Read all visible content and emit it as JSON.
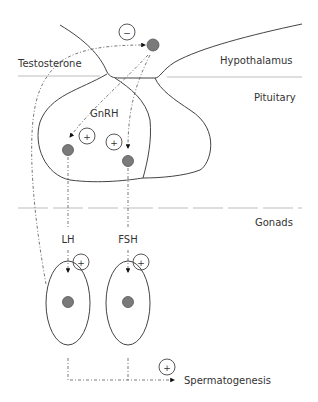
{
  "diagram": {
    "regions": {
      "hypothalamus": "Hypothalamus",
      "pituitary": "Pituitary",
      "gonads": "Gonads"
    },
    "hormones": {
      "testosterone": "Testosterone",
      "gnrh": "GnRH",
      "lh": "LH",
      "fsh": "FSH"
    },
    "outcome": "Spermatogenesis",
    "signs": {
      "negative": "−",
      "positive": "+"
    },
    "nodes": [
      {
        "id": "hypothalamic-neuron",
        "region": "Hypothalamus"
      },
      {
        "id": "pituitary-cell-lh",
        "region": "Pituitary"
      },
      {
        "id": "pituitary-cell-fsh",
        "region": "Pituitary"
      },
      {
        "id": "gonad-cell-leydig",
        "region": "Gonads"
      },
      {
        "id": "gonad-cell-sertoli",
        "region": "Gonads"
      }
    ],
    "edges": [
      {
        "from": "gonad-cell-leydig",
        "to": "hypothalamic-neuron",
        "label": "Testosterone",
        "effect": "−"
      },
      {
        "from": "hypothalamic-neuron",
        "to": "pituitary-cell-lh",
        "label": "GnRH",
        "effect": "+"
      },
      {
        "from": "hypothalamic-neuron",
        "to": "pituitary-cell-fsh",
        "label": "GnRH",
        "effect": "+"
      },
      {
        "from": "pituitary-cell-lh",
        "to": "gonad-cell-leydig",
        "label": "LH",
        "effect": "+"
      },
      {
        "from": "pituitary-cell-fsh",
        "to": "gonad-cell-sertoli",
        "label": "FSH",
        "effect": "+"
      },
      {
        "from": "gonad-cells",
        "to": "Spermatogenesis",
        "label": "",
        "effect": "+"
      }
    ],
    "colors": {
      "nucleus": "#7a7a7a",
      "outline": "#444444",
      "region_line": "#bdbdbd",
      "text": "#333333"
    }
  }
}
